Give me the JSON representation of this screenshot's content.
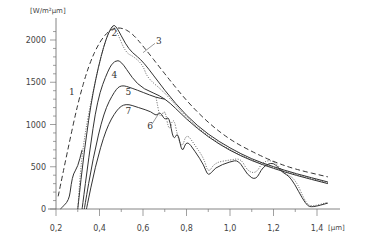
{
  "chart_data": {
    "type": "line",
    "title": "",
    "xlabel": "[µm]",
    "ylabel": "[W/m²µm]",
    "xlim": [
      0.2,
      1.45
    ],
    "ylim": [
      0,
      2200
    ],
    "grid": false,
    "legend": "inline numeric labels 1-7",
    "x_ticks": [
      "0,2",
      "0,4",
      "0,6",
      "0,8",
      "1,0",
      "1,2",
      "1,4"
    ],
    "x_tick_values": [
      0.2,
      0.4,
      0.6,
      0.8,
      1.0,
      1.2,
      1.4
    ],
    "y_ticks": [
      "0",
      "500",
      "1000",
      "1500",
      "2000"
    ],
    "y_tick_values": [
      0,
      500,
      1000,
      1500,
      2000
    ],
    "series": [
      {
        "name": "1",
        "style": "dashed",
        "points": [
          [
            0.21,
            150
          ],
          [
            0.25,
            650
          ],
          [
            0.3,
            1250
          ],
          [
            0.35,
            1700
          ],
          [
            0.4,
            1980
          ],
          [
            0.45,
            2130
          ],
          [
            0.5,
            2150
          ],
          [
            0.55,
            2080
          ],
          [
            0.6,
            1930
          ],
          [
            0.7,
            1600
          ],
          [
            0.8,
            1280
          ],
          [
            0.9,
            1020
          ],
          [
            1.0,
            820
          ],
          [
            1.1,
            680
          ],
          [
            1.2,
            560
          ],
          [
            1.3,
            470
          ],
          [
            1.45,
            380
          ]
        ]
      },
      {
        "name": "2",
        "style": "solid",
        "points": [
          [
            0.3,
            0
          ],
          [
            0.33,
            700
          ],
          [
            0.37,
            1400
          ],
          [
            0.42,
            1950
          ],
          [
            0.46,
            2190
          ],
          [
            0.48,
            2150
          ],
          [
            0.52,
            1950
          ],
          [
            0.55,
            1850
          ],
          [
            0.6,
            1750
          ],
          [
            0.7,
            1400
          ],
          [
            0.8,
            1100
          ],
          [
            0.9,
            880
          ],
          [
            1.0,
            720
          ],
          [
            1.1,
            590
          ],
          [
            1.2,
            500
          ],
          [
            1.3,
            420
          ],
          [
            1.45,
            320
          ]
        ]
      },
      {
        "name": "3",
        "style": "dotted",
        "points": [
          [
            0.3,
            0
          ],
          [
            0.32,
            700
          ],
          [
            0.37,
            1400
          ],
          [
            0.42,
            1950
          ],
          [
            0.46,
            2190
          ],
          [
            0.48,
            2100
          ],
          [
            0.52,
            1850
          ],
          [
            0.56,
            1800
          ],
          [
            0.6,
            1700
          ],
          [
            0.62,
            1550
          ],
          [
            0.7,
            1380
          ],
          [
            0.8,
            1080
          ],
          [
            0.9,
            860
          ],
          [
            1.0,
            700
          ],
          [
            1.1,
            580
          ],
          [
            1.2,
            490
          ],
          [
            1.3,
            410
          ],
          [
            1.45,
            310
          ]
        ]
      },
      {
        "name": "4",
        "style": "solid",
        "points": [
          [
            0.32,
            0
          ],
          [
            0.35,
            600
          ],
          [
            0.39,
            1300
          ],
          [
            0.44,
            1650
          ],
          [
            0.47,
            1760
          ],
          [
            0.5,
            1750
          ],
          [
            0.55,
            1550
          ],
          [
            0.6,
            1420
          ],
          [
            0.7,
            1320
          ],
          [
            0.8,
            1060
          ],
          [
            0.9,
            850
          ],
          [
            1.0,
            690
          ],
          [
            1.1,
            570
          ],
          [
            1.2,
            480
          ],
          [
            1.3,
            400
          ],
          [
            1.45,
            300
          ]
        ]
      },
      {
        "name": "5",
        "style": "solid",
        "points": [
          [
            0.33,
            0
          ],
          [
            0.37,
            600
          ],
          [
            0.42,
            1150
          ],
          [
            0.47,
            1400
          ],
          [
            0.5,
            1470
          ],
          [
            0.55,
            1430
          ],
          [
            0.6,
            1380
          ],
          [
            0.66,
            1320
          ],
          [
            0.7,
            1300
          ]
        ]
      },
      {
        "name": "6",
        "style": "dotted",
        "points": [
          [
            0.66,
            1320
          ],
          [
            0.68,
            1050
          ],
          [
            0.7,
            1200
          ],
          [
            0.72,
            900
          ],
          [
            0.74,
            1100
          ],
          [
            0.76,
            850
          ],
          [
            0.78,
            720
          ],
          [
            0.8,
            900
          ],
          [
            0.84,
            750
          ],
          [
            0.88,
            600
          ],
          [
            0.9,
            420
          ],
          [
            0.93,
            550
          ],
          [
            1.0,
            580
          ],
          [
            1.05,
            600
          ],
          [
            1.08,
            450
          ],
          [
            1.12,
            420
          ],
          [
            1.15,
            560
          ],
          [
            1.2,
            580
          ],
          [
            1.25,
            420
          ],
          [
            1.3,
            360
          ],
          [
            1.35,
            60
          ],
          [
            1.38,
            30
          ],
          [
            1.45,
            80
          ]
        ]
      },
      {
        "name": "7",
        "style": "solid",
        "points": [
          [
            0.34,
            0
          ],
          [
            0.38,
            500
          ],
          [
            0.43,
            950
          ],
          [
            0.48,
            1180
          ],
          [
            0.52,
            1250
          ],
          [
            0.58,
            1200
          ],
          [
            0.64,
            1150
          ],
          [
            0.66,
            1100
          ],
          [
            0.68,
            1150
          ],
          [
            0.7,
            1050
          ],
          [
            0.72,
            1100
          ],
          [
            0.74,
            800
          ],
          [
            0.76,
            920
          ],
          [
            0.78,
            650
          ],
          [
            0.8,
            820
          ],
          [
            0.84,
            680
          ],
          [
            0.88,
            520
          ],
          [
            0.9,
            380
          ],
          [
            0.93,
            490
          ],
          [
            1.0,
            560
          ],
          [
            1.04,
            580
          ],
          [
            1.08,
            400
          ],
          [
            1.12,
            340
          ],
          [
            1.15,
            500
          ],
          [
            1.2,
            560
          ],
          [
            1.24,
            430
          ],
          [
            1.28,
            380
          ],
          [
            1.35,
            40
          ],
          [
            1.38,
            20
          ],
          [
            1.45,
            70
          ]
        ]
      },
      {
        "name": "lower-left",
        "style": "solid",
        "points": [
          [
            0.22,
            0
          ],
          [
            0.26,
            100
          ],
          [
            0.27,
            300
          ],
          [
            0.28,
            420
          ],
          [
            0.3,
            500
          ],
          [
            0.32,
            700
          ]
        ]
      }
    ],
    "annotations": [
      {
        "text": "1",
        "x": 0.26,
        "y": 1350
      },
      {
        "text": "2",
        "x": 0.455,
        "y": 2050
      },
      {
        "text": "3",
        "x": 0.66,
        "y": 1950
      },
      {
        "text": "4",
        "x": 0.455,
        "y": 1550
      },
      {
        "text": "5",
        "x": 0.52,
        "y": 1350
      },
      {
        "text": "6",
        "x": 0.62,
        "y": 950
      },
      {
        "text": "7",
        "x": 0.52,
        "y": 1120
      }
    ]
  }
}
